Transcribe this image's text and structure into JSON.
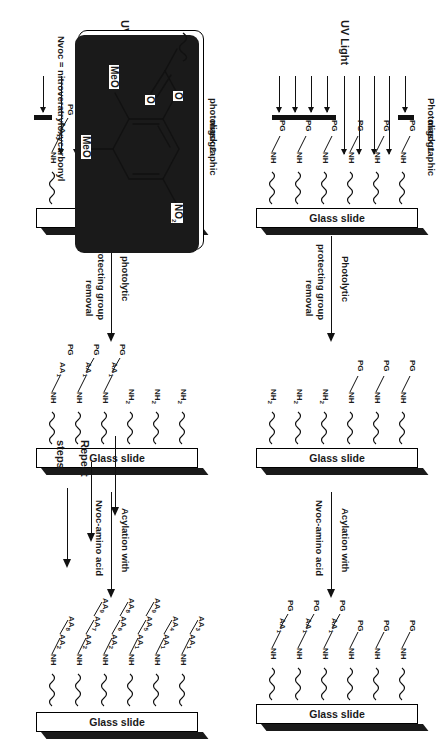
{
  "figure": {
    "background_color": "#ffffff",
    "ink_color": "#1a1a1a"
  },
  "labels": {
    "uv_light": "UV Light",
    "glass_slide": "Glass slide",
    "mask_1_line1": "Photoligographic",
    "mask_1_line2": "mask 1",
    "mask_2_line1": "photoligographic",
    "mask_2_line2": "mask 2",
    "deprotect_1_line1": "Photolytic",
    "deprotect_1_line2": "protecting group",
    "deprotect_1_line3": "removal",
    "deprotect_2_line1": "photolytic",
    "deprotect_2_line2": "protecting group",
    "deprotect_2_line3": "removal",
    "acylation_line1": "Acylation with",
    "acylation_line2": "Nvoc-amino acid",
    "repeat_line1": "Repeat",
    "repeat_line2": "steps",
    "nvoc_legend": "Nvoc = nitroveratryloxycarbonyl"
  },
  "chem": {
    "pg": "PG",
    "nh": "NH",
    "nh2_base": "NH",
    "nh2_sub": "2",
    "aa": "AA",
    "meo": "MeO",
    "no2_base": "NO",
    "no2_sub": "2",
    "oxygen": "O"
  },
  "panels": [
    {
      "id": "panel-1",
      "name": "uv-exposure-mask-1",
      "stage": "UV Light through photoligographic mask 1",
      "surface_top_labels": [
        "PG",
        "PG",
        "PG",
        "PG",
        "PG",
        "PG",
        "PG",
        "PG",
        "PG"
      ],
      "surface_groups": [
        "NH",
        "NH",
        "NH",
        "NH",
        "NH",
        "NH"
      ],
      "ray_count": 9,
      "mask_bars": 2
    },
    {
      "id": "panel-2",
      "name": "deprotected-surface",
      "stage": "after photolytic protecting group removal",
      "surface_top_labels": [
        "PG",
        "PG",
        "PG"
      ],
      "surface_groups": [
        "NH",
        "NH",
        "NH",
        "NH2",
        "NH2",
        "NH2"
      ]
    },
    {
      "id": "panel-3",
      "name": "acylated-surface-aa1",
      "stage": "after acylation with Nvoc-amino acid",
      "surface_top_labels": [
        "PG",
        "PG",
        "PG",
        "PG",
        "PG",
        "PG",
        "PG",
        "PG",
        "PG"
      ],
      "surface_groups": [
        "NH",
        "NH",
        "NH",
        "NH",
        "NH",
        "NH"
      ],
      "amino_acids": [
        "AA1",
        "AA1",
        "AA1"
      ]
    },
    {
      "id": "panel-4",
      "name": "uv-exposure-mask-2",
      "stage": "UV Light through photoligographic mask 2",
      "surface_top_labels": [
        "PG",
        "PG",
        "PG",
        "PG",
        "PG",
        "PG",
        "PG",
        "PG",
        "PG"
      ],
      "surface_groups": [
        "NH",
        "NH",
        "NH",
        "NH",
        "NH",
        "NH"
      ],
      "amino_acids": [
        "AA1",
        "AA1",
        "AA1"
      ],
      "ray_count": 10,
      "mask_bars": 2
    },
    {
      "id": "panel-5",
      "name": "deprotected-surface-2",
      "stage": "after second photolytic protecting group removal",
      "surface_top_labels": [
        "PG",
        "PG",
        "PG"
      ],
      "surface_groups": [
        "NH",
        "NH",
        "NH2",
        "NH2",
        "NH2"
      ],
      "amino_acids": [
        "AA1",
        "AA1"
      ]
    },
    {
      "id": "panel-6",
      "name": "final-peptide-array",
      "stage": "final array after repeated cycles",
      "surface_groups": [
        "NH",
        "NH",
        "NH",
        "NH",
        "NH",
        "NH"
      ],
      "amino_acids": [
        "AA1",
        "AA2",
        "AA3",
        "AA4",
        "AA5",
        "AA6",
        "AA7",
        "AA8",
        "AA9"
      ]
    }
  ],
  "structure": {
    "name": "nvoc-protecting-group",
    "substituents": {
      "meo_top": "MeO",
      "meo_bottom": "MeO",
      "nitro": "NO2",
      "carbonyl_o": "O",
      "ester_o": "O"
    },
    "legend": "Nvoc = nitroveratryloxycarbonyl"
  }
}
